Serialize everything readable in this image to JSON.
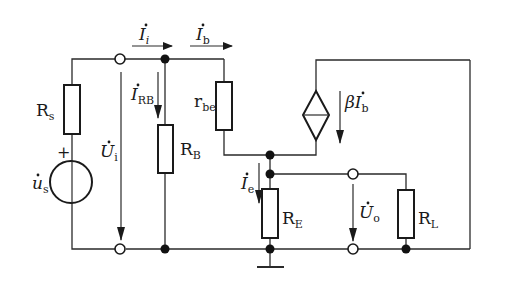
{
  "diagram": {
    "type": "small-signal equivalent circuit (common-collector / emitter follower)",
    "components": {
      "Rs": {
        "label": "R",
        "sub": "s"
      },
      "us": {
        "label": "u",
        "sub": "s",
        "polarity": "+"
      },
      "RB": {
        "label": "R",
        "sub": "B"
      },
      "rbe": {
        "label": "r",
        "sub": "be"
      },
      "RE": {
        "label": "R",
        "sub": "E"
      },
      "RL": {
        "label": "R",
        "sub": "L"
      },
      "ccs": {
        "label": "βI",
        "sub": "b"
      }
    },
    "currents": {
      "Ii": {
        "label": "I",
        "sub": "i"
      },
      "Ib": {
        "label": "I",
        "sub": "b"
      },
      "IRB": {
        "label": "I",
        "sub": "RB"
      },
      "Ie": {
        "label": "I",
        "sub": "e"
      }
    },
    "voltages": {
      "Ui": {
        "label": "U",
        "sub": "i"
      },
      "Uo": {
        "label": "U",
        "sub": "o"
      }
    },
    "colors": {
      "line": "#1a1a1a",
      "background": "#ffffff"
    }
  }
}
